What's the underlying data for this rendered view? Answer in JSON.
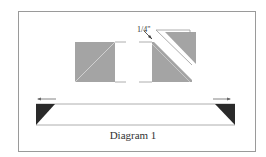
{
  "diagram": {
    "caption": "Diagram 1",
    "measurement_label": "1/4\"",
    "colors": {
      "square_fill": "#a4a4a4",
      "dark_triangle": "#2a2a2a",
      "line": "#888888",
      "frame": "#9a9a9a"
    },
    "elements": [
      "left-square-with-diagonal",
      "right-square-cut-diagonally",
      "gap-annotation-arrow",
      "long-strip-with-triangle-ends",
      "left-arrow",
      "right-arrow"
    ]
  }
}
